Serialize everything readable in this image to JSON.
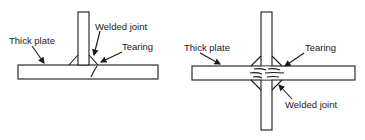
{
  "figures": [
    {
      "id": "tee-joint",
      "labels": {
        "thick_plate": "Thick plate",
        "welded_joint": "Welded joint",
        "tearing": "Tearing"
      }
    },
    {
      "id": "cruciform-joint",
      "labels": {
        "thick_plate": "Thick plate",
        "tearing": "Tearing",
        "welded_joint": "Welded joint"
      }
    }
  ],
  "colors": {
    "line": "#1a1a1a",
    "background": "#ffffff"
  }
}
